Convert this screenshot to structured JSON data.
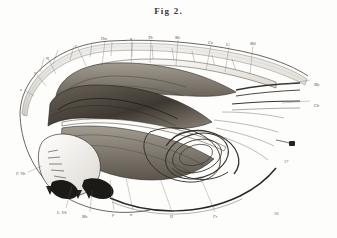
{
  "plate": {
    "title": "Fig 2.",
    "background_color": "#fdfdfc",
    "ink_color": "#3a3732",
    "subject": "anatomical-engraving-sagittal-head-section"
  },
  "labels": [
    {
      "text": "N",
      "x": 46,
      "y": 57,
      "italic": false
    },
    {
      "text": "V",
      "x": 34,
      "y": 72,
      "italic": true
    },
    {
      "text": "e",
      "x": 20,
      "y": 88,
      "italic": true
    },
    {
      "text": "I",
      "x": 75,
      "y": 45,
      "italic": true
    },
    {
      "text": "Hm",
      "x": 101,
      "y": 37,
      "italic": true
    },
    {
      "text": "a",
      "x": 130,
      "y": 37,
      "italic": true
    },
    {
      "text": "Th",
      "x": 148,
      "y": 36,
      "italic": true
    },
    {
      "text": "Mc",
      "x": 175,
      "y": 36,
      "italic": true
    },
    {
      "text": "Ce",
      "x": 208,
      "y": 41,
      "italic": true
    },
    {
      "text": "Li",
      "x": 226,
      "y": 43,
      "italic": true
    },
    {
      "text": "Md",
      "x": 250,
      "y": 42,
      "italic": true
    },
    {
      "text": "My",
      "x": 314,
      "y": 83,
      "italic": true
    },
    {
      "text": "Ch",
      "x": 314,
      "y": 104,
      "italic": true
    },
    {
      "text": "17",
      "x": 284,
      "y": 160,
      "italic": false
    },
    {
      "text": "F. Vb",
      "x": 16,
      "y": 172,
      "italic": true
    },
    {
      "text": "L. Vb",
      "x": 57,
      "y": 211,
      "italic": true
    },
    {
      "text": "Mx",
      "x": 82,
      "y": 215,
      "italic": true
    },
    {
      "text": "p",
      "x": 112,
      "y": 213,
      "italic": true
    },
    {
      "text": "n",
      "x": 130,
      "y": 213,
      "italic": true
    },
    {
      "text": "H",
      "x": 170,
      "y": 215,
      "italic": false
    },
    {
      "text": "Fr",
      "x": 213,
      "y": 215,
      "italic": true
    },
    {
      "text": "10",
      "x": 274,
      "y": 212,
      "italic": false
    }
  ]
}
